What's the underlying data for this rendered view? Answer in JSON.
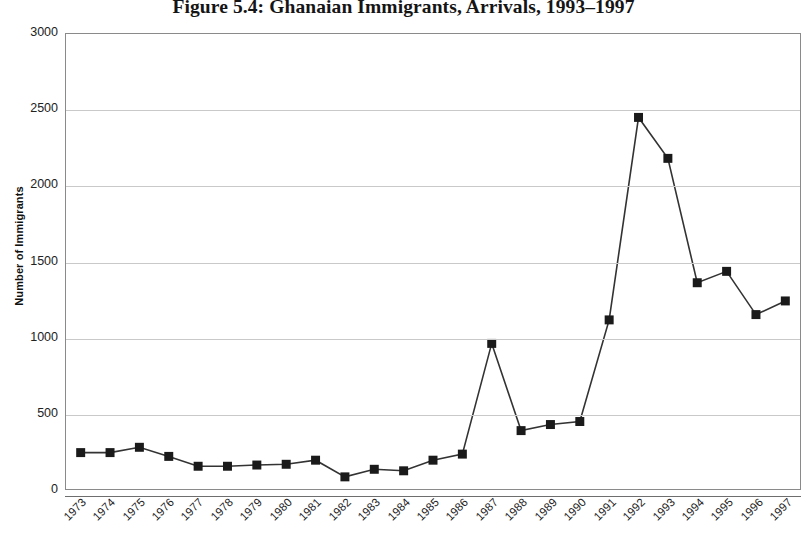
{
  "chart_data": {
    "type": "line",
    "title": "Figure 5.4: Ghanaian Immigrants, Arrivals, 1993–1997",
    "xlabel": "",
    "ylabel": "Number of Immigrants",
    "ylim": [
      0,
      3000
    ],
    "y_ticks": [
      0,
      500,
      1000,
      1500,
      2000,
      2500,
      3000
    ],
    "y_tick_labels": [
      "0",
      "500",
      "1000",
      "1500",
      "2000",
      "2500",
      "3000"
    ],
    "grid": true,
    "legend": null,
    "marker": "square",
    "marker_color": "#1a1a1a",
    "line_color": "#333333",
    "categories": [
      "1973",
      "1974",
      "1975",
      "1976",
      "1977",
      "1978",
      "1979",
      "1980",
      "1981",
      "1982",
      "1983",
      "1984",
      "1985",
      "1986",
      "1987",
      "1988",
      "1989",
      "1990",
      "1991",
      "1992",
      "1993",
      "1994",
      "1995",
      "1996",
      "1997"
    ],
    "values": [
      240,
      240,
      275,
      215,
      150,
      150,
      158,
      163,
      190,
      80,
      130,
      120,
      190,
      230,
      960,
      385,
      425,
      445,
      1115,
      2450,
      2180,
      1360,
      1435,
      1150,
      1240
    ]
  }
}
